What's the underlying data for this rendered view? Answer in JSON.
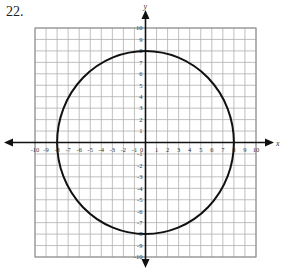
{
  "problem": {
    "number": "22."
  },
  "graph": {
    "x_axis_label": "x",
    "y_axis_label": "y",
    "x_min": -10,
    "x_max": 10,
    "y_min": -10,
    "y_max": 10,
    "grid_step": 1,
    "x_tick_labels": [
      "-10",
      "-9",
      "-8",
      "-7",
      "-6",
      "-5",
      "-4",
      "-3",
      "-2",
      "-1",
      "0",
      "1",
      "2",
      "3",
      "4",
      "5",
      "6",
      "7",
      "8",
      "9",
      "10"
    ],
    "y_tick_labels": [
      "10",
      "9",
      "8",
      "7",
      "6",
      "5",
      "4",
      "3",
      "2",
      "1",
      "-1",
      "-2",
      "-3",
      "-4",
      "-5",
      "-6",
      "-7",
      "-8",
      "-9",
      "-10"
    ],
    "colors": {
      "grid": "#b0b0b0",
      "axis": "#111111",
      "curve": "#111111",
      "border": "#888888"
    }
  },
  "chart_data": {
    "type": "line",
    "title": "22.",
    "xlabel": "x",
    "ylabel": "y",
    "xlim": [
      -10,
      10
    ],
    "ylim": [
      -10,
      10
    ],
    "grid": true,
    "series": [
      {
        "name": "circle",
        "shape": "circle",
        "center": [
          0,
          0
        ],
        "radius": 8,
        "equation": "x^2 + y^2 = 64",
        "key_points": [
          [
            8,
            0
          ],
          [
            0,
            8
          ],
          [
            -8,
            0
          ],
          [
            0,
            -8
          ]
        ]
      }
    ]
  }
}
